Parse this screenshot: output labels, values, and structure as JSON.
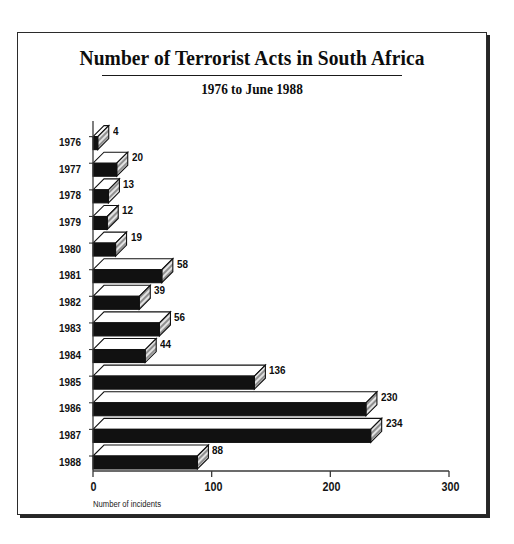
{
  "chart_data": {
    "type": "bar",
    "orientation": "horizontal",
    "title": "Number of Terrorist Acts in South Africa",
    "subtitle": "1976 to June 1988",
    "xlabel": "Number of incidents",
    "ylabel": "",
    "categories": [
      "1976",
      "1977",
      "1978",
      "1979",
      "1980",
      "1981",
      "1982",
      "1983",
      "1984",
      "1985",
      "1986",
      "1987",
      "1988"
    ],
    "values": [
      4,
      20,
      13,
      12,
      19,
      58,
      39,
      56,
      44,
      136,
      230,
      234,
      88
    ],
    "xticks": [
      "0",
      "100",
      "200",
      "300"
    ],
    "xtick_values": [
      0,
      100,
      200,
      300
    ],
    "xlim": [
      0,
      300
    ],
    "grid": false,
    "legend": false,
    "data_labels": true,
    "style": "3d-bars",
    "colors": {
      "bar_front": "#111111",
      "bar_top": "#ffffff",
      "bar_cap": "#c8c8c8",
      "outline": "#111111",
      "axis": "#3a3a3a",
      "frame": "#2b2b2b",
      "background": "#ffffff",
      "text": "#0d0d0d"
    }
  }
}
